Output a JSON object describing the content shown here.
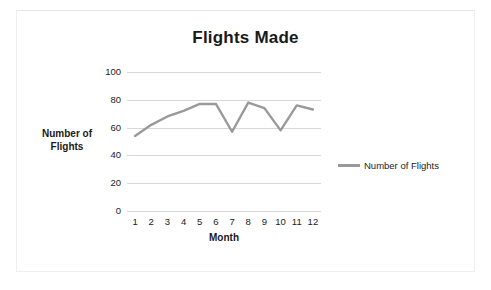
{
  "chart_data": {
    "type": "line",
    "title": "Flights Made",
    "xlabel": "Month",
    "ylabel": "Number of Flights",
    "categories": [
      "1",
      "2",
      "3",
      "4",
      "5",
      "6",
      "7",
      "8",
      "9",
      "10",
      "11",
      "12"
    ],
    "series": [
      {
        "name": "Number of Flights",
        "color": "#9a9a9a",
        "values": [
          54,
          62,
          68,
          72,
          77,
          77,
          57,
          78,
          74,
          58,
          76,
          73
        ]
      }
    ],
    "ylim": [
      0,
      100
    ],
    "yticks": [
      0,
      20,
      40,
      60,
      80,
      100
    ],
    "ytick_labels": [
      "0",
      "20",
      "40",
      "60",
      "80",
      "100"
    ],
    "grid": "horizontal",
    "legend": {
      "position": "right",
      "entries": [
        "Number of Flights"
      ]
    }
  },
  "style": {
    "background": "#ffffff",
    "line_color": "#9a9a9a",
    "gridline_color": "#d8d8d8",
    "text_color": "#222222"
  }
}
